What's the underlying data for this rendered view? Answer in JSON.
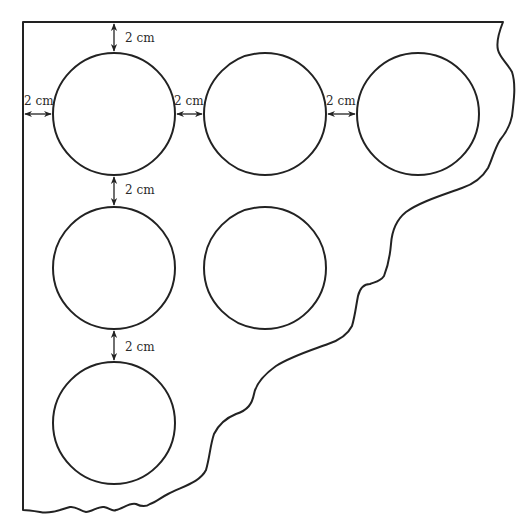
{
  "diagram": {
    "type": "sheet-with-circular-cutouts",
    "stroke_color": "#222222",
    "background": "#ffffff",
    "sheet": {
      "description": "Irregular sheet with straight top and left edges and a torn wavy edge on the bottom-right"
    },
    "circles": [
      {
        "id": "row1-col1",
        "cx": 114,
        "cy": 114,
        "r": 61
      },
      {
        "id": "row1-col2",
        "cx": 265,
        "cy": 114,
        "r": 61
      },
      {
        "id": "row1-col3",
        "cx": 418,
        "cy": 114,
        "r": 61
      },
      {
        "id": "row2-col1",
        "cx": 114,
        "cy": 268,
        "r": 61
      },
      {
        "id": "row2-col2",
        "cx": 265,
        "cy": 268,
        "r": 61
      },
      {
        "id": "row3-col1",
        "cx": 114,
        "cy": 423,
        "r": 61
      }
    ],
    "dimensions": [
      {
        "id": "top-gap",
        "label": "2 cm",
        "orientation": "vertical",
        "from": "top edge",
        "to": "circle row1-col1"
      },
      {
        "id": "left-gap",
        "label": "2 cm",
        "orientation": "horizontal",
        "from": "left edge",
        "to": "circle row1-col1"
      },
      {
        "id": "gap-col1-col2",
        "label": "2 cm",
        "orientation": "horizontal",
        "from": "circle row1-col1",
        "to": "circle row1-col2"
      },
      {
        "id": "gap-col2-col3",
        "label": "2 cm",
        "orientation": "horizontal",
        "from": "circle row1-col2",
        "to": "circle row1-col3"
      },
      {
        "id": "gap-row1-row2",
        "label": "2 cm",
        "orientation": "vertical",
        "from": "circle row1-col1",
        "to": "circle row2-col1"
      },
      {
        "id": "gap-row2-row3",
        "label": "2 cm",
        "orientation": "vertical",
        "from": "circle row2-col1",
        "to": "circle row3-col1"
      }
    ]
  }
}
